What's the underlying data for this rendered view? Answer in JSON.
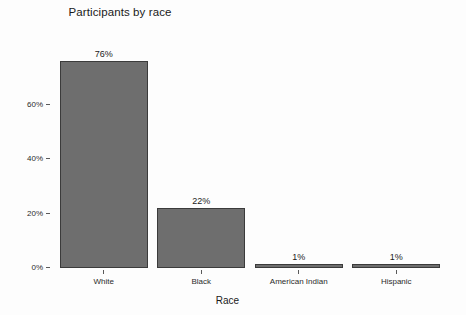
{
  "chart_data": {
    "type": "bar",
    "title": "Participants by race",
    "xlabel": "Race",
    "ylabel": "Percent",
    "categories": [
      "White",
      "Black",
      "American Indian",
      "Hispanic"
    ],
    "values": [
      76,
      22,
      1,
      1
    ],
    "value_labels": [
      "76%",
      "22%",
      "1%",
      "1%"
    ],
    "ylim": [
      0,
      80
    ],
    "ytick_values": [
      0,
      20,
      40,
      60
    ],
    "ytick_labels": [
      "0%",
      "20%",
      "40%",
      "60%"
    ],
    "grid": false,
    "legend": "none",
    "bar_color": "#6e6e6e",
    "bar_border_color": "#3b3b3b",
    "background_color": "#fdfdfd",
    "text_color": "#1a1a1a"
  }
}
